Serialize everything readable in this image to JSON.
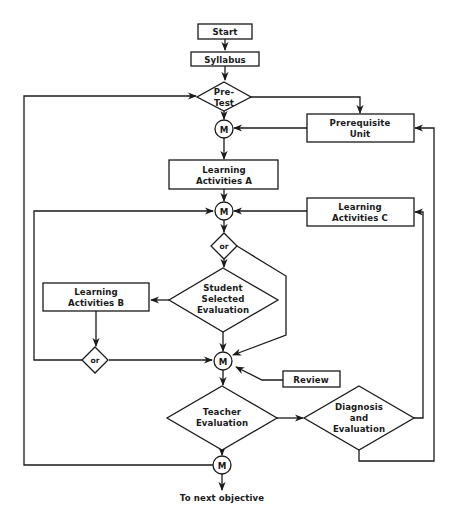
{
  "diagram": {
    "type": "flowchart",
    "nodes": {
      "start": {
        "label": "Start",
        "shape": "rect"
      },
      "syllabus": {
        "label": "Syllabus",
        "shape": "rect"
      },
      "pretest": {
        "label_lines": [
          "Pre-",
          "Test"
        ],
        "shape": "diamond"
      },
      "merge1": {
        "label": "M",
        "shape": "circle"
      },
      "prerequisite": {
        "label_lines": [
          "Prerequisite",
          "Unit"
        ],
        "shape": "rect"
      },
      "activities_a": {
        "label_lines": [
          "Learning",
          "Activities A"
        ],
        "shape": "rect"
      },
      "merge2": {
        "label": "M",
        "shape": "circle"
      },
      "activities_c": {
        "label_lines": [
          "Learning",
          "Activities C"
        ],
        "shape": "rect"
      },
      "or1": {
        "label": "or",
        "shape": "diamond"
      },
      "student_eval": {
        "label_lines": [
          "Student",
          "Selected",
          "Evaluation"
        ],
        "shape": "diamond"
      },
      "activities_b": {
        "label_lines": [
          "Learning",
          "Activities B"
        ],
        "shape": "rect"
      },
      "or2": {
        "label": "or",
        "shape": "diamond"
      },
      "merge3": {
        "label": "M",
        "shape": "circle"
      },
      "review": {
        "label": "Review",
        "shape": "rect"
      },
      "teacher_eval": {
        "label_lines": [
          "Teacher",
          "Evaluation"
        ],
        "shape": "diamond"
      },
      "diagnosis": {
        "label_lines": [
          "Diagnosis",
          "and",
          "Evaluation"
        ],
        "shape": "diamond"
      },
      "merge4": {
        "label": "M",
        "shape": "circle"
      }
    },
    "exit_label": "To next objective",
    "edges": [
      [
        "start",
        "syllabus"
      ],
      [
        "syllabus",
        "pretest"
      ],
      [
        "pretest",
        "merge1"
      ],
      [
        "pretest",
        "prerequisite"
      ],
      [
        "prerequisite",
        "merge1"
      ],
      [
        "merge1",
        "activities_a"
      ],
      [
        "activities_a",
        "merge2"
      ],
      [
        "activities_c",
        "merge2"
      ],
      [
        "merge2",
        "or1"
      ],
      [
        "or1",
        "student_eval"
      ],
      [
        "or1",
        "merge3"
      ],
      [
        "student_eval",
        "activities_b"
      ],
      [
        "student_eval",
        "merge3"
      ],
      [
        "activities_b",
        "or2"
      ],
      [
        "or2",
        "merge2"
      ],
      [
        "or2",
        "merge3"
      ],
      [
        "review",
        "merge3"
      ],
      [
        "merge3",
        "teacher_eval"
      ],
      [
        "teacher_eval",
        "diagnosis"
      ],
      [
        "teacher_eval",
        "merge4"
      ],
      [
        "diagnosis",
        "activities_c"
      ],
      [
        "diagnosis",
        "prerequisite"
      ],
      [
        "merge4",
        "pretest"
      ],
      [
        "merge4",
        "exit"
      ]
    ]
  }
}
